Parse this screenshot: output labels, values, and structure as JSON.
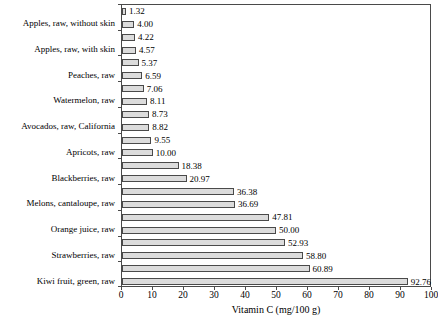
{
  "colors": {
    "bar_fill": "#dcdcdc",
    "bar_border": "#4a4a4a",
    "axis": "#4a4a4a",
    "text": "#000000",
    "background": "#ffffff"
  },
  "chart_data": {
    "type": "bar",
    "orientation": "horizontal",
    "title": "",
    "xlabel": "Vitamin C (mg/100 g)",
    "ylabel": "",
    "xlim": [
      0,
      100
    ],
    "xticks": [
      0,
      10,
      20,
      30,
      40,
      50,
      60,
      70,
      80,
      90,
      100
    ],
    "grid": false,
    "legend": "none",
    "value_label_decimals": 2,
    "categories": [
      "Apples, raw, without skin",
      "Apples, raw, with skin",
      "Peaches, raw",
      "Watermelon, raw",
      "Avocados, raw, California",
      "Apricots, raw",
      "Blackberries, raw",
      "Melons, cantaloupe, raw",
      "Orange juice, raw",
      "Strawberries, raw",
      "Kiwi fruit, green, raw"
    ],
    "series": [
      {
        "name": "upper-bar",
        "values": [
          1.32,
          4.22,
          5.37,
          7.06,
          8.73,
          9.55,
          18.38,
          36.38,
          47.81,
          52.93,
          60.89
        ]
      },
      {
        "name": "lower-bar",
        "values": [
          4.0,
          4.57,
          6.59,
          8.11,
          8.82,
          10.0,
          20.97,
          36.69,
          50.0,
          58.8,
          92.76
        ]
      }
    ]
  }
}
